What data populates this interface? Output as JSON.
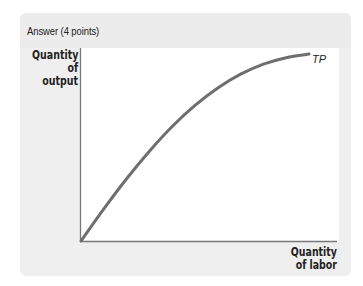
{
  "header": {
    "title": "Answer (4 points)"
  },
  "chart_data": {
    "type": "line",
    "title": "",
    "xlabel": "Quantity of labor",
    "ylabel": "Quantity of output",
    "ylabel_lines": [
      "Quantity",
      "of output"
    ],
    "xlabel_lines": [
      "Quantity",
      "of labor"
    ],
    "grid": false,
    "legend": null,
    "annotations": [
      "TP"
    ],
    "series": [
      {
        "name": "TP",
        "description": "Total product curve, increasing at a diminishing rate (concave)",
        "x": [
          0,
          1,
          2,
          3,
          4,
          5,
          6,
          7,
          8,
          9,
          10
        ],
        "values": [
          0,
          1.75,
          3.4,
          4.9,
          6.25,
          7.4,
          8.35,
          9.1,
          9.65,
          10.0,
          10.2
        ]
      }
    ],
    "xlim": [
      0,
      11
    ],
    "ylim": [
      0,
      11
    ],
    "colors": {
      "curve": "#6e6e6e",
      "axes": "#777777"
    }
  }
}
